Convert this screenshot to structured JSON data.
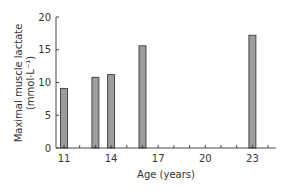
{
  "chart_data": {
    "type": "bar",
    "title": "",
    "xlabel": "Age (years)",
    "ylabel": "Maximal muscle lactate",
    "ylabel_unit": "(mmol·L⁻¹)",
    "x": [
      11,
      13,
      14,
      16,
      23
    ],
    "values": [
      9.1,
      10.8,
      11.2,
      15.6,
      17.2
    ],
    "x_ticks": [
      11,
      12,
      13,
      14,
      15,
      16,
      17,
      18,
      19,
      20,
      21,
      22,
      23,
      24
    ],
    "x_tick_labels": [
      "11",
      "14",
      "17",
      "20",
      "23"
    ],
    "y_ticks": [
      0,
      5,
      10,
      15,
      20
    ],
    "y_tick_labels": [
      "0",
      "5",
      "10",
      "15",
      "20"
    ],
    "ylim": [
      0,
      20
    ],
    "xlim": [
      10.5,
      24.5
    ],
    "grid": false,
    "legend": null,
    "colors": {
      "bar_fill": "#9c9c9c",
      "bar_stroke": "#3a3a3a",
      "axis": "#333333"
    }
  }
}
